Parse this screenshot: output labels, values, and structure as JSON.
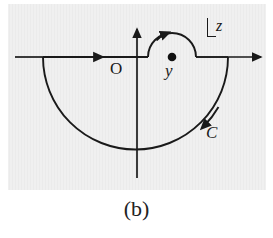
{
  "figure": {
    "caption": "(b)",
    "background_color": "#ebebeb",
    "page_color": "#ffffff",
    "ink_color": "#1a1a1a",
    "width": 273,
    "height": 238
  },
  "labels": {
    "origin": "O",
    "pole": "y",
    "contour": "C",
    "plane": "z"
  },
  "diagram_data": {
    "type": "complex-contour-diagram",
    "description": "Contour integration path in the complex z-plane: a large clockwise semicircle in the lower half-plane closed along the real axis, with a small semicircular indentation above the real axis detouring over a simple pole at z = y.",
    "axes": {
      "real_axis": {
        "orientation": "horizontal",
        "y_pixel": 57,
        "x_start": 15,
        "x_end": 263,
        "arrowhead": "right-end"
      },
      "imaginary_axis": {
        "orientation": "vertical",
        "x_pixel": 137,
        "y_start": 178,
        "y_end": 27,
        "arrowhead": "top-end"
      },
      "origin_pixel": [
        137,
        57
      ]
    },
    "pole": {
      "label": "y",
      "marker": "filled-dot",
      "position_pixel": [
        172,
        57
      ],
      "radius_px": 4
    },
    "large_arc": {
      "shape": "semicircle",
      "half_plane": "lower",
      "center_pixel": [
        135.5,
        57
      ],
      "radius_px": 92.5,
      "start_pixel": [
        43,
        57
      ],
      "end_pixel": [
        228,
        57
      ],
      "direction": "clockwise",
      "label": "C",
      "arrow_at_pixel": [
        205,
        125
      ],
      "arrow_direction": "down-left"
    },
    "small_arc": {
      "shape": "semicircle",
      "half_plane": "upper",
      "center_pixel": [
        172,
        57
      ],
      "radius_px": 24,
      "start_pixel": [
        148,
        57
      ],
      "end_pixel": [
        196,
        57
      ],
      "direction": "clockwise-over-pole",
      "arrow_at_pixel": [
        166,
        33
      ],
      "arrow_direction": "right"
    },
    "axis_segments": [
      {
        "from_pixel": [
          43,
          57
        ],
        "to_pixel": [
          148,
          57
        ],
        "arrow_at_pixel": [
          95,
          57
        ],
        "arrow_direction": "right"
      },
      {
        "from_pixel": [
          196,
          57
        ],
        "to_pixel": [
          228,
          57
        ],
        "arrow": "none"
      }
    ],
    "plane_label": {
      "text": "z",
      "style": "italic-with-corner-bracket",
      "position_pixel": [
        216,
        18
      ]
    }
  }
}
